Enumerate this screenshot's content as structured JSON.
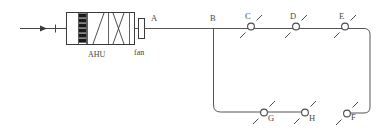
{
  "diagram": {
    "type": "hvac-schematic",
    "canvas": {
      "width": 392,
      "height": 135
    },
    "colors": {
      "background": "#ffffff",
      "duct_stroke": "#555555",
      "component_stroke": "#3a3a3a",
      "damper_blade": "#1a1a1a",
      "label_text": "#4a4a4a"
    }
  },
  "components": {
    "ahu": {
      "label": "AHU",
      "sections": [
        {
          "name": "damper",
          "symbol": "stacked-blades",
          "blade_count": 6
        },
        {
          "name": "heating-coil",
          "symbol": "single-diagonal"
        },
        {
          "name": "cooling-coil",
          "symbol": "crossed-diagonal"
        }
      ]
    },
    "fan": {
      "label": "fan",
      "symbol": "fan-block"
    },
    "inlet": {
      "symbol": "arrow-with-tick",
      "direction": "right"
    }
  },
  "ports": [
    {
      "id": "A",
      "label": "A",
      "x": 154,
      "y": 22,
      "description": "AHU discharge outlet"
    },
    {
      "id": "B",
      "label": "B",
      "x": 213,
      "y": 22,
      "description": "main duct branch tee"
    }
  ],
  "nodes": [
    {
      "id": "C",
      "label": "C",
      "cx": 251,
      "cy": 26,
      "branch": "upper",
      "type": "damper-valve"
    },
    {
      "id": "D",
      "label": "D",
      "cx": 296,
      "cy": 26,
      "branch": "upper",
      "type": "damper-valve"
    },
    {
      "id": "E",
      "label": "E",
      "cx": 345,
      "cy": 26,
      "branch": "upper",
      "type": "damper-valve"
    },
    {
      "id": "F",
      "label": "F",
      "cx": 347,
      "cy": 113,
      "branch": "right-riser",
      "type": "damper-valve"
    },
    {
      "id": "G",
      "label": "G",
      "cx": 264,
      "cy": 112,
      "branch": "lower",
      "type": "damper-valve"
    },
    {
      "id": "H",
      "label": "H",
      "cx": 305,
      "cy": 112,
      "branch": "lower",
      "type": "damper-valve"
    }
  ],
  "connections": [
    {
      "from": "inlet",
      "to": "AHU",
      "path": "horizontal"
    },
    {
      "from": "A",
      "to": "B",
      "path": "horizontal"
    },
    {
      "from": "B",
      "to": "C",
      "path": "horizontal"
    },
    {
      "from": "C",
      "to": "D",
      "path": "horizontal"
    },
    {
      "from": "D",
      "to": "E",
      "path": "horizontal"
    },
    {
      "from": "E",
      "to": "F",
      "path": "right-then-down"
    },
    {
      "from": "B",
      "to": "G",
      "path": "down-then-right"
    },
    {
      "from": "G",
      "to": "H",
      "path": "horizontal"
    }
  ]
}
